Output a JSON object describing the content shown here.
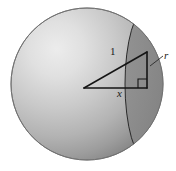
{
  "figure": {
    "name": "sphere-with-spherical-cap",
    "background_color": "#ffffff",
    "labels": {
      "hypotenuse": "1",
      "horizontal_leg": "x",
      "cap_radius": "r"
    },
    "colors": {
      "sphere_light": "#e8e8e8",
      "sphere_mid": "#b5b5b5",
      "sphere_dark": "#7d7d7d",
      "sphere_edge": "#6f6f6f",
      "cap_front": "#8f8f8f",
      "cap_dark": "#6a6a6a",
      "line": "#1a1a1a"
    },
    "geometry": {
      "sphere_center_px": [
        87,
        84
      ],
      "sphere_radius_px": 76,
      "highlight_px": [
        55,
        45
      ],
      "triangle_apex_px": [
        84,
        88
      ],
      "triangle_top_px": [
        147,
        52
      ],
      "triangle_corner_px": [
        147,
        88
      ],
      "cap_plane_x_px": 147,
      "label_positions": {
        "hypotenuse": [
          112,
          52
        ],
        "horizontal_leg": [
          118,
          91
        ],
        "cap_radius": [
          164,
          52
        ]
      }
    }
  }
}
